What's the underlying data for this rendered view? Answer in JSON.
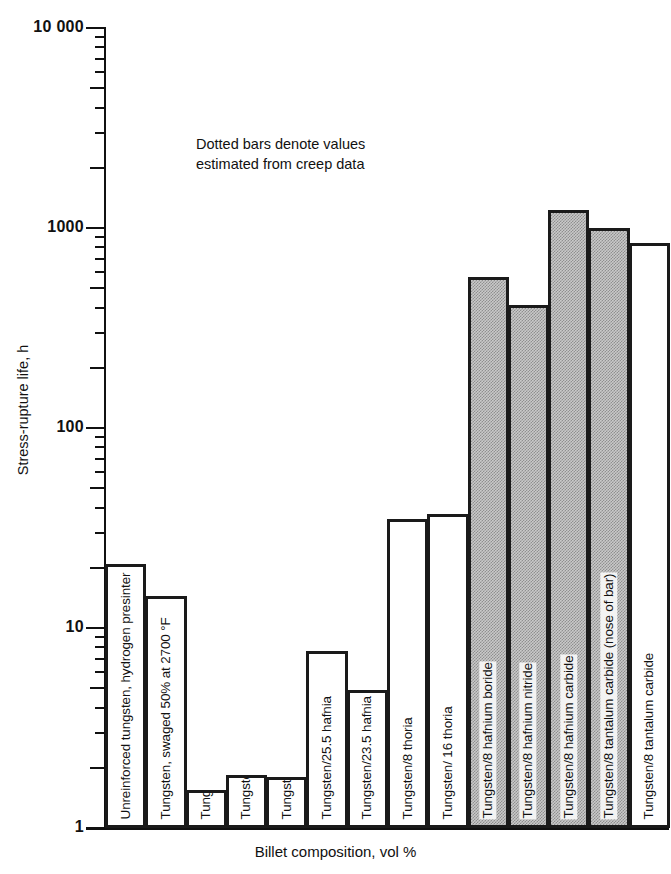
{
  "chart_data": {
    "type": "bar",
    "title": "",
    "xlabel": "Billet composition, vol %",
    "ylabel": "Stress-rupture life, h",
    "yscale": "log",
    "ylim": [
      1,
      10000
    ],
    "ytick_labels": [
      "10 000",
      "1000",
      "100",
      "10",
      "1"
    ],
    "ytick_values": [
      10000,
      1000,
      100,
      10,
      1
    ],
    "grid": false,
    "legend": null,
    "annotation": "Dotted bars denote values estimated from creep data",
    "annotation_line1": "Dotted bars denote values",
    "annotation_line2": "estimated from creep data",
    "categories": [
      "Unreinforced tungsten, hydrogen presinter",
      "Tungsten, swaged 50% at 2700 °F",
      "Tungsten/14.5 zirconia",
      "Tungsten/20.5 zirconia",
      "Tungsten/20.5 yttria",
      "Tungsten/25.5 hafnia",
      "Tungsten/23.5 hafnia",
      "Tungsten/8 thoria",
      "Tungsten/ 16 thoria",
      "Tungsten/8 hafnium boride",
      "Tungsten/8 hafnium nitride",
      "Tungsten/8 hafnium carbide",
      "Tungsten/8 tantalum carbide (nose of bar)",
      "Tungsten/8 tantalum carbide"
    ],
    "values": [
      21,
      14.5,
      1.55,
      1.85,
      1.8,
      7.7,
      4.9,
      35,
      37,
      570,
      410,
      1230,
      1000,
      840
    ],
    "styles": [
      "open",
      "open",
      "open",
      "open",
      "open",
      "open",
      "open",
      "open",
      "open",
      "dotted",
      "dotted",
      "dotted",
      "dotted",
      "open"
    ]
  },
  "axes": {
    "y_title": "Stress-rupture life, h",
    "x_title": "Billet composition, vol %",
    "y_labels": [
      "10 000",
      "1000",
      "100",
      "10",
      "1"
    ]
  },
  "annotation": {
    "line1": "Dotted bars denote values",
    "line2": "estimated from creep data"
  },
  "bars": [
    {
      "label": "Unreinforced tungsten, hydrogen presinter",
      "value": 21,
      "style": "open"
    },
    {
      "label": "Tungsten, swaged 50% at 2700 °F",
      "value": 14.5,
      "style": "open"
    },
    {
      "label": "Tungsten/14.5 zirconia",
      "value": 1.55,
      "style": "open"
    },
    {
      "label": "Tungsten/20.5 zirconia",
      "value": 1.85,
      "style": "open"
    },
    {
      "label": "Tungsten/20.5 yttria",
      "value": 1.8,
      "style": "open"
    },
    {
      "label": "Tungsten/25.5 hafnia",
      "value": 7.7,
      "style": "open"
    },
    {
      "label": "Tungsten/23.5 hafnia",
      "value": 4.9,
      "style": "open"
    },
    {
      "label": "Tungsten/8 thoria",
      "value": 35,
      "style": "open"
    },
    {
      "label": "Tungsten/ 16 thoria",
      "value": 37,
      "style": "open"
    },
    {
      "label": "Tungsten/8 hafnium boride",
      "value": 570,
      "style": "dotted"
    },
    {
      "label": "Tungsten/8 hafnium nitride",
      "value": 410,
      "style": "dotted"
    },
    {
      "label": "Tungsten/8 hafnium carbide",
      "value": 1230,
      "style": "dotted"
    },
    {
      "label": "Tungsten/8 tantalum carbide (nose of bar)",
      "value": 1000,
      "style": "dotted"
    },
    {
      "label": "Tungsten/8 tantalum carbide",
      "value": 840,
      "style": "open"
    }
  ],
  "colors": {
    "ink": "#111111",
    "bar_outline": "#1a1a1a",
    "bar_open_fill": "#ffffff",
    "bar_dotted_fill": "#c9c9c9",
    "background": "#ffffff"
  }
}
